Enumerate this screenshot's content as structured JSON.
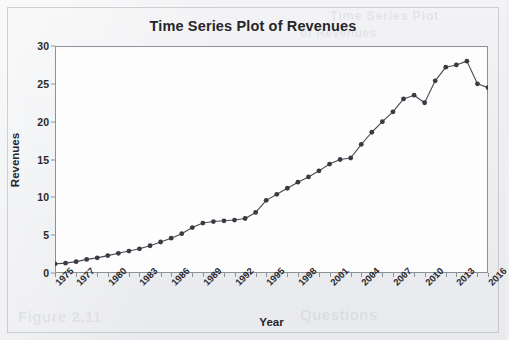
{
  "chart_data": {
    "type": "line",
    "title": "Time Series Plot of Revenues",
    "xlabel": "Year",
    "ylabel": "Revenues",
    "xlim": [
      1975,
      2016
    ],
    "ylim": [
      0,
      30
    ],
    "yticks": [
      0,
      5,
      10,
      15,
      20,
      25,
      30
    ],
    "xticks": [
      1975,
      1977,
      1980,
      1983,
      1986,
      1989,
      1992,
      1995,
      1998,
      2001,
      2004,
      2007,
      2010,
      2013,
      2016
    ],
    "grid": false,
    "legend": null,
    "marker": "filled-circle",
    "line_color": "#4a4a52",
    "marker_color": "#3a3a42",
    "x": [
      1975,
      1976,
      1977,
      1978,
      1979,
      1980,
      1981,
      1982,
      1983,
      1984,
      1985,
      1986,
      1987,
      1988,
      1989,
      1990,
      1991,
      1992,
      1993,
      1994,
      1995,
      1996,
      1997,
      1998,
      1999,
      2000,
      2001,
      2002,
      2003,
      2004,
      2005,
      2006,
      2007,
      2008,
      2009,
      2010,
      2011,
      2012,
      2013,
      2014,
      2015,
      2016
    ],
    "values": [
      1.2,
      1.3,
      1.5,
      1.8,
      2.0,
      2.3,
      2.6,
      2.9,
      3.2,
      3.6,
      4.1,
      4.6,
      5.2,
      6.0,
      6.6,
      6.8,
      6.9,
      7.0,
      7.2,
      8.0,
      9.6,
      10.4,
      11.2,
      12.0,
      12.7,
      13.5,
      14.4,
      15.0,
      15.2,
      17.0,
      18.6,
      20.0,
      21.3,
      23.0,
      23.5,
      22.5,
      25.4,
      27.2,
      27.5,
      28.0,
      25.0,
      24.5
    ]
  },
  "page": {
    "bleed_text_1": "Time Series Plot",
    "bleed_text_2": "of Revenues",
    "bleed_text_3": "Figure 2.11",
    "bleed_text_4": "Questions"
  }
}
